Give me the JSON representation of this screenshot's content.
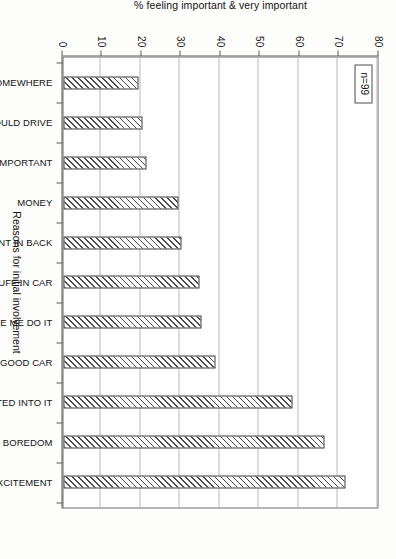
{
  "chart_data": {
    "type": "bar",
    "title": "",
    "subtitle": "",
    "xlabel": "Reasons for initial involvement",
    "ylabel": "% feeling important & very important",
    "orientation": "vertical",
    "grid": true,
    "legend": "none",
    "ylim": [
      0,
      80
    ],
    "ytick_step": 10,
    "ticks": [
      "0",
      "10",
      "20",
      "30",
      "40",
      "50",
      "60",
      "70",
      "80"
    ],
    "categories": [
      "TO GO SOMEWHERE",
      "SHOW I COULD DRIVE",
      "FEEL IMPORTANT",
      "MONEY",
      "JUST WENT IN BACK",
      "GOOD STUFF IN CAR",
      "MATES MADE ME DO IT",
      "GOOD CAR",
      "DRIFTED INTO IT",
      "BOREDOM",
      "EXCITEMENT"
    ],
    "values": [
      19,
      20,
      21,
      29,
      30,
      34.5,
      35,
      38.5,
      58,
      66,
      71.5
    ],
    "annotations": [
      {
        "name": "sample-size",
        "text": "n=99"
      }
    ],
    "bar_style": {
      "fill": "diagonal-hatch",
      "hatch_color": "#4a4a4a",
      "background": "#ffffff",
      "border_color": "#3c3c3c"
    }
  },
  "figure": {
    "page_rotation_degrees": 90,
    "background": "#fdfdfc"
  }
}
